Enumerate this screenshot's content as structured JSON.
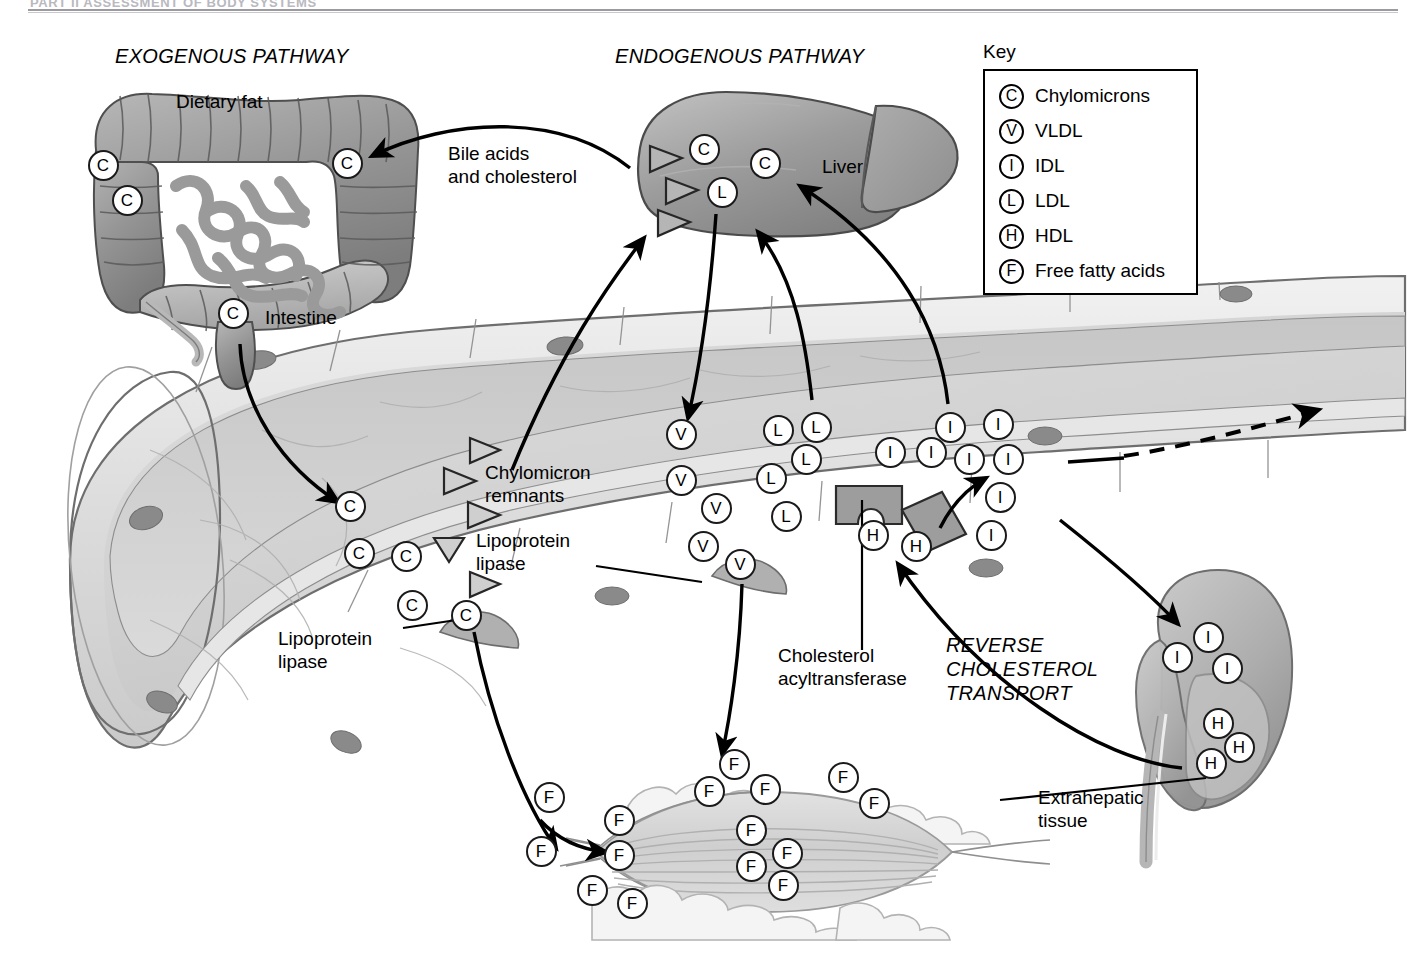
{
  "page_header": {
    "text": "PART II  ASSESSMENT OF BODY SYSTEMS",
    "visible_note": "cropped at top edge"
  },
  "titles": {
    "exogenous": "EXOGENOUS PATHWAY",
    "endogenous": "ENDOGENOUS PATHWAY",
    "reverse_transport": "REVERSE\nCHOLESTEROL\nTRANSPORT"
  },
  "key": {
    "heading": "Key",
    "items": [
      {
        "symbol": "C",
        "label": "Chylomicrons"
      },
      {
        "symbol": "V",
        "label": "VLDL"
      },
      {
        "symbol": "I",
        "label": "IDL"
      },
      {
        "symbol": "L",
        "label": "LDL"
      },
      {
        "symbol": "H",
        "label": "HDL"
      },
      {
        "symbol": "F",
        "label": "Free fatty acids"
      }
    ]
  },
  "labels": {
    "dietary_fat": "Dietary fat",
    "intestine": "Intestine",
    "bile_acids": "Bile acids\nand cholesterol",
    "liver": "Liver",
    "chylomicron_remnants": "Chylomicron\nremnants",
    "lipoprotein_lipase_left": "Lipoprotein\nlipase",
    "lipoprotein_lipase_right": "Lipoprotein\nlipase",
    "cholesterol_acyltransferase": "Cholesterol\nacyltransferase",
    "extrahepatic_tissue": "Extrahepatic\ntissue"
  },
  "colors": {
    "ink": "#000000",
    "organ_mid": "#9a9a9a",
    "organ_dark": "#6f6f6f",
    "organ_light": "#c9c9c9",
    "vessel_wall": "#e3e3e3",
    "vessel_lumen": "#d5d5d5",
    "vessel_lumen_dark": "#bdbdbd",
    "nucleus": "#8a8a8a",
    "enzyme_block": "#9d9d9d",
    "rule_gray": "#9a9aa0"
  },
  "particles": {
    "intestine": [
      {
        "symbol": "C",
        "x": 103,
        "y": 165
      },
      {
        "symbol": "C",
        "x": 127,
        "y": 200
      },
      {
        "symbol": "C",
        "x": 347,
        "y": 163
      },
      {
        "symbol": "C",
        "x": 233,
        "y": 313
      }
    ],
    "liver": [
      {
        "symbol": "C",
        "x": 704,
        "y": 149
      },
      {
        "symbol": "C",
        "x": 765,
        "y": 163
      },
      {
        "symbol": "L",
        "x": 722,
        "y": 192
      }
    ],
    "vessel_chylomicrons": [
      {
        "symbol": "C",
        "x": 350,
        "y": 506
      },
      {
        "symbol": "C",
        "x": 359,
        "y": 553
      },
      {
        "symbol": "C",
        "x": 406,
        "y": 556
      },
      {
        "symbol": "C",
        "x": 412,
        "y": 605
      },
      {
        "symbol": "C",
        "x": 466,
        "y": 615
      }
    ],
    "vessel_vldl": [
      {
        "symbol": "V",
        "x": 681,
        "y": 434
      },
      {
        "symbol": "V",
        "x": 681,
        "y": 480
      },
      {
        "symbol": "V",
        "x": 716,
        "y": 508
      },
      {
        "symbol": "V",
        "x": 703,
        "y": 546
      },
      {
        "symbol": "V",
        "x": 740,
        "y": 564
      }
    ],
    "vessel_ldl": [
      {
        "symbol": "L",
        "x": 816,
        "y": 427
      },
      {
        "symbol": "L",
        "x": 778,
        "y": 430
      },
      {
        "symbol": "L",
        "x": 806,
        "y": 459
      },
      {
        "symbol": "L",
        "x": 771,
        "y": 478
      },
      {
        "symbol": "L",
        "x": 786,
        "y": 516
      }
    ],
    "vessel_idl": [
      {
        "symbol": "I",
        "x": 950,
        "y": 427
      },
      {
        "symbol": "I",
        "x": 998,
        "y": 424
      },
      {
        "symbol": "I",
        "x": 890,
        "y": 452
      },
      {
        "symbol": "I",
        "x": 931,
        "y": 452
      },
      {
        "symbol": "I",
        "x": 969,
        "y": 459
      },
      {
        "symbol": "I",
        "x": 1008,
        "y": 459
      },
      {
        "symbol": "I",
        "x": 1000,
        "y": 497
      },
      {
        "symbol": "I",
        "x": 991,
        "y": 535
      }
    ],
    "vessel_hdl": [
      {
        "symbol": "H",
        "x": 873,
        "y": 535
      },
      {
        "symbol": "H",
        "x": 916,
        "y": 546
      }
    ],
    "kidney_idl": [
      {
        "symbol": "I",
        "x": 1208,
        "y": 637
      },
      {
        "symbol": "I",
        "x": 1177,
        "y": 657
      },
      {
        "symbol": "I",
        "x": 1227,
        "y": 668
      }
    ],
    "kidney_hdl": [
      {
        "symbol": "H",
        "x": 1218,
        "y": 723
      },
      {
        "symbol": "H",
        "x": 1239,
        "y": 747
      },
      {
        "symbol": "H",
        "x": 1211,
        "y": 763
      }
    ],
    "muscle_ffa": [
      {
        "symbol": "F",
        "x": 734,
        "y": 764
      },
      {
        "symbol": "F",
        "x": 709,
        "y": 791
      },
      {
        "symbol": "F",
        "x": 765,
        "y": 789
      },
      {
        "symbol": "F",
        "x": 843,
        "y": 777
      },
      {
        "symbol": "F",
        "x": 874,
        "y": 803
      },
      {
        "symbol": "F",
        "x": 619,
        "y": 820
      },
      {
        "symbol": "F",
        "x": 619,
        "y": 855
      },
      {
        "symbol": "F",
        "x": 751,
        "y": 830
      },
      {
        "symbol": "F",
        "x": 787,
        "y": 853
      },
      {
        "symbol": "F",
        "x": 751,
        "y": 866
      },
      {
        "symbol": "F",
        "x": 783,
        "y": 885
      },
      {
        "symbol": "F",
        "x": 592,
        "y": 890
      },
      {
        "symbol": "F",
        "x": 632,
        "y": 903
      },
      {
        "symbol": "F",
        "x": 549,
        "y": 797
      },
      {
        "symbol": "F",
        "x": 541,
        "y": 851
      }
    ]
  },
  "chylomicron_remnant_triangles": [
    {
      "x": 472,
      "y": 449,
      "rot": 0
    },
    {
      "x": 448,
      "y": 478,
      "rot": 0
    },
    {
      "x": 470,
      "y": 512,
      "rot": 0
    },
    {
      "x": 449,
      "y": 546,
      "rot": 90
    },
    {
      "x": 472,
      "y": 582,
      "rot": 0
    }
  ],
  "liver_triangles": [
    {
      "x": 652,
      "y": 158
    },
    {
      "x": 668,
      "y": 190
    },
    {
      "x": 660,
      "y": 222
    }
  ],
  "arrows": [
    {
      "name": "intestine-to-liver-bile",
      "style": "solid"
    },
    {
      "name": "intestine-to-vessel-chylomicron",
      "style": "solid"
    },
    {
      "name": "remnants-to-liver",
      "style": "solid"
    },
    {
      "name": "liver-to-vldl",
      "style": "solid"
    },
    {
      "name": "ldl-to-liver",
      "style": "solid"
    },
    {
      "name": "idl-to-liver",
      "style": "solid"
    },
    {
      "name": "idl-to-ldl-conversion",
      "style": "solid"
    },
    {
      "name": "vessel-to-kidney",
      "style": "solid"
    },
    {
      "name": "hdl-reverse-transport",
      "style": "solid"
    },
    {
      "name": "vldl-to-muscle",
      "style": "solid"
    },
    {
      "name": "chylomicron-to-muscle",
      "style": "solid"
    },
    {
      "name": "ffa-into-muscle",
      "style": "solid"
    },
    {
      "name": "vessel-outflow",
      "style": "dashed"
    }
  ]
}
